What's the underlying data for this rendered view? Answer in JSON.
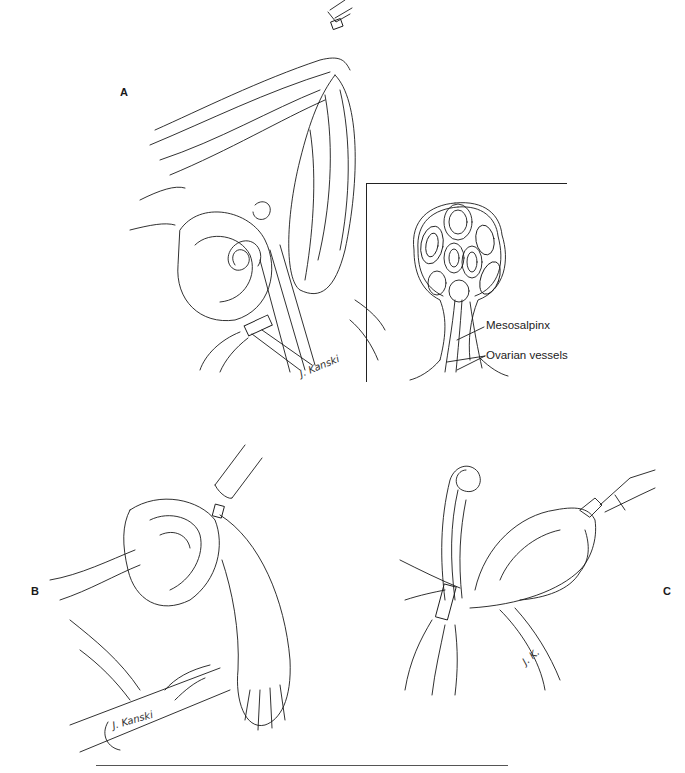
{
  "figure": {
    "panels": [
      {
        "id": "A",
        "label": "A",
        "signature": "J. Kanski"
      },
      {
        "id": "B",
        "label": "B",
        "signature": "J. Kanski"
      },
      {
        "id": "C",
        "label": "C",
        "signature": "J. K."
      }
    ],
    "inset": {
      "labels": [
        "Mesosalpinx",
        "Ovarian vessels"
      ]
    }
  },
  "colors": {
    "ink": "#1a1a1a",
    "background": "#ffffff",
    "rule": "#555555"
  }
}
